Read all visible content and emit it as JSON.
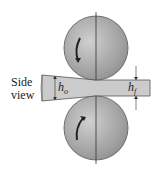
{
  "diagram": {
    "label_side_line1": "Side",
    "label_side_line2": "view",
    "label_initial_thickness": "h",
    "label_initial_sub": "o",
    "label_final_thickness": "h",
    "label_final_sub": "f",
    "colors": {
      "roll": "#a8a8a8",
      "strip": "#c8c8c8",
      "outline": "#444444"
    }
  }
}
